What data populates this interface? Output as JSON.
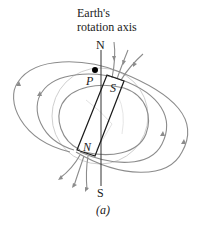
{
  "figure": {
    "axis_label_line1": "Earth's",
    "axis_label_line2": "rotation axis",
    "geographic_north": "N",
    "geographic_south": "S",
    "point_label": "P",
    "magnet_south_pole": "S",
    "magnet_north_pole": "N",
    "caption": "(a)"
  },
  "colors": {
    "field_lines": "#8c8c8c",
    "earth_outline": "#c8c8c8",
    "magnet_outline": "#1a1a1a",
    "axis_line": "#333333",
    "point": "#000000"
  }
}
